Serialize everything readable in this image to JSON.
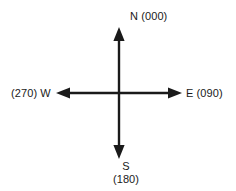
{
  "diagram": {
    "stroke_color": "#1a1a1a",
    "background_color": "#ffffff",
    "center": {
      "x": 119,
      "y": 93
    },
    "axes": {
      "north": {
        "label": "N (000)",
        "direction_letter": "N",
        "bearing": "000",
        "tip": {
          "x": 119,
          "y": 28
        }
      },
      "east": {
        "label": "E (090)",
        "direction_letter": "E",
        "bearing": "090",
        "tip": {
          "x": 181,
          "y": 93
        }
      },
      "south": {
        "label_letter": "S",
        "label_bearing": "(180)",
        "direction_letter": "S",
        "bearing": "180",
        "tip": {
          "x": 119,
          "y": 158
        }
      },
      "west": {
        "label": "(270) W",
        "direction_letter": "W",
        "bearing": "270",
        "tip": {
          "x": 57,
          "y": 93
        }
      }
    }
  }
}
